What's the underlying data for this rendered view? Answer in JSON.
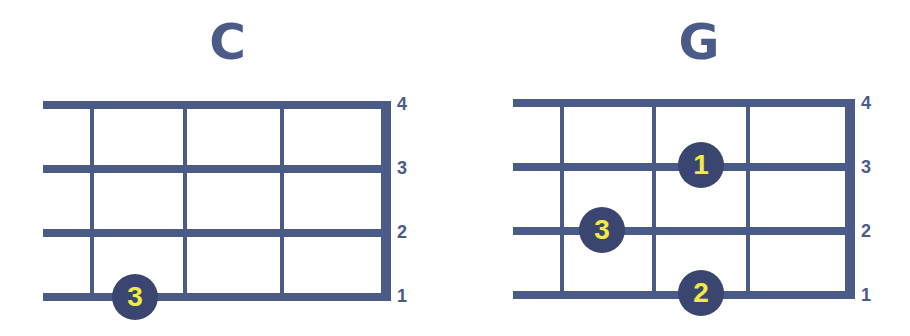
{
  "colors": {
    "line": "#4b5b88",
    "dot": "#3a4670",
    "finger_text": "#f3ea45",
    "background": "#ffffff"
  },
  "chords": [
    {
      "name": "C",
      "string_labels": [
        "4",
        "3",
        "2",
        "1"
      ],
      "fingers": [
        {
          "finger": "3",
          "string": "1",
          "fret": "1"
        }
      ]
    },
    {
      "name": "G",
      "string_labels": [
        "4",
        "3",
        "2",
        "1"
      ],
      "fingers": [
        {
          "finger": "1",
          "string": "3",
          "fret": "2"
        },
        {
          "finger": "3",
          "string": "2",
          "fret": "1"
        },
        {
          "finger": "2",
          "string": "1",
          "fret": "2"
        }
      ]
    }
  ]
}
